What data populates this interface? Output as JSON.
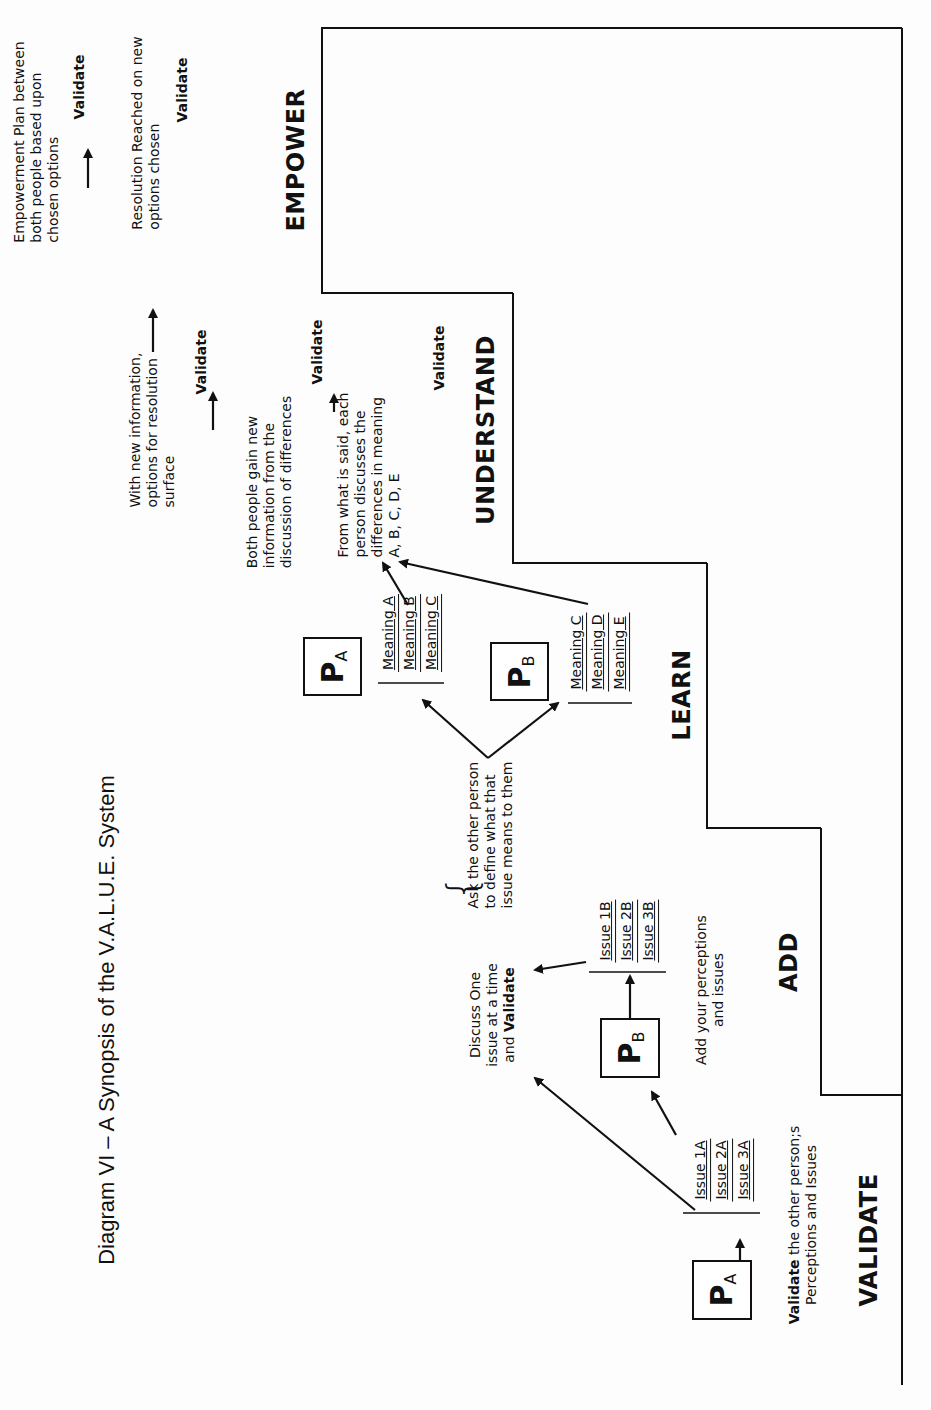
{
  "title": "Diagram VI – A Synopsis of the V.A.L.U.E. System",
  "stages": [
    {
      "id": "validate",
      "label": "VALIDATE"
    },
    {
      "id": "add",
      "label": "ADD"
    },
    {
      "id": "learn",
      "label": "LEARN"
    },
    {
      "id": "understand",
      "label": "UNDERSTAND"
    },
    {
      "id": "empower",
      "label": "EMPOWER"
    }
  ],
  "validate_stage": {
    "person": {
      "letter": "P",
      "sub": "A"
    },
    "issues": [
      "Issue 1A",
      "Issue 2A",
      "Issue 3A"
    ],
    "caption_bold": "Validate",
    "caption_rest": " the other person;s",
    "caption_line2": "Perceptions and Issues"
  },
  "add_stage": {
    "person": {
      "letter": "P",
      "sub": "B"
    },
    "issues": [
      "Issue 1B",
      "Issue 2B",
      "Issue 3B"
    ],
    "caption_line1": "Add your perceptions",
    "caption_line2": "and issues",
    "discuss_line1": "Discuss One",
    "discuss_line2": "issue at a time",
    "discuss_line3_pre": "and ",
    "discuss_line3_bold": "Validate",
    "ask_line1": "Ask the other person",
    "ask_line2": "to define what that",
    "ask_line3": "issue means to them"
  },
  "learn_stage": {
    "person_a": {
      "letter": "P",
      "sub": "A"
    },
    "meanings_a": [
      "Meaning A",
      "Meaning B",
      "Meaning C"
    ],
    "person_b": {
      "letter": "P",
      "sub": "B"
    },
    "meanings_b": [
      "Meaning C",
      "Meaning D",
      "Meaning E"
    ]
  },
  "understand_stage": {
    "from_what": [
      "From what is said, each",
      "person discusses the",
      "differences in meaning",
      "A, B, C, D, E"
    ],
    "both_people": [
      "Both people gain new",
      "information from the",
      "discussion of differences"
    ],
    "with_new": [
      "With new information,",
      "options for resolution",
      "surface"
    ],
    "validate_labels": [
      "Validate",
      "Validate",
      "Validate"
    ]
  },
  "empower_stage": {
    "resolution": [
      "Resolution Reached on new",
      "options chosen"
    ],
    "plan": [
      "Empowerment Plan between",
      "both people based upon",
      "chosen options"
    ],
    "validate_labels": [
      "Validate",
      "Validate"
    ]
  }
}
